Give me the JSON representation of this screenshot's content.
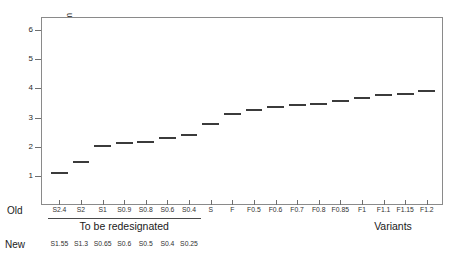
{
  "chart_data": {
    "type": "bar",
    "title": "",
    "xlabel": "Variants",
    "ylabel": "Relative position, cm",
    "ylim": [
      0,
      6.45
    ],
    "yticks": [
      1,
      2,
      3,
      4,
      5,
      6
    ],
    "grid": false,
    "legend": null,
    "categories": [
      "S2.4",
      "S2",
      "S1",
      "S0.9",
      "S0.8",
      "S0.6",
      "S0.4",
      "S",
      "F",
      "F0.5",
      "F0.6",
      "F0.7",
      "F0.8",
      "F0.85",
      "F1",
      "F1.1",
      "F1.15",
      "F1.2"
    ],
    "values": [
      1.15,
      1.5,
      2.05,
      2.15,
      2.2,
      2.35,
      2.45,
      2.8,
      3.15,
      3.3,
      3.4,
      3.45,
      3.5,
      3.6,
      3.7,
      3.8,
      3.85,
      3.95
    ],
    "series": [
      {
        "name": "Relative position",
        "values": [
          1.15,
          1.5,
          2.05,
          2.15,
          2.2,
          2.35,
          2.45,
          2.8,
          3.15,
          3.3,
          3.4,
          3.45,
          3.5,
          3.6,
          3.7,
          3.8,
          3.85,
          3.95
        ]
      }
    ],
    "marker_color": "#3b3b3b"
  },
  "axes": {
    "y_title": "Relative position, cm",
    "y_tick_labels": [
      "1",
      "2",
      "3",
      "4",
      "5",
      "6"
    ],
    "x_variants_label": "Variants"
  },
  "bottom_rows": {
    "old_row_label": "Old",
    "new_row_label": "New",
    "old_labels": [
      "S2.4",
      "S2",
      "S1",
      "S0.9",
      "S0.8",
      "S0.6",
      "S0.4",
      "S",
      "F",
      "F0.5",
      "F0.6",
      "F0.7",
      "F0.8",
      "F0.85",
      "F1",
      "F1.1",
      "F1.15",
      "F1.2"
    ],
    "new_labels": [
      "S1.55",
      "S1.3",
      "S0.65",
      "S0.6",
      "S0.5",
      "S0.4",
      "S0.25"
    ],
    "redesignated_note": "To be redesignated"
  }
}
